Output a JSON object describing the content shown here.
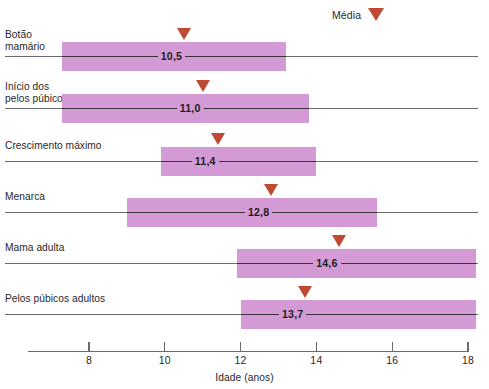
{
  "legend": {
    "label": "Média",
    "marker_icon": "down-triangle-icon",
    "marker_color": "#bf4a33"
  },
  "axis": {
    "title": "Idade (anos)",
    "ticks": [
      "8",
      "10",
      "12",
      "14",
      "16",
      "18"
    ],
    "tick_values": [
      8,
      10,
      12,
      14,
      16,
      18
    ],
    "min": 7.0,
    "max": 18.0
  },
  "colors": {
    "band": "#d49ad6",
    "marker": "#bf4a33",
    "line": "#6e6a6b",
    "text": "#2b2726"
  },
  "rows": [
    {
      "label": "Botão\nmamário",
      "value": "10,5",
      "mean": 10.5,
      "range_start": 7.3,
      "range_end": 13.2
    },
    {
      "label": "Início dos\npelos púbicos",
      "value": "11,0",
      "mean": 11.0,
      "range_start": 7.3,
      "range_end": 13.8
    },
    {
      "label": "Crescimento máximo",
      "value": "11,4",
      "mean": 11.4,
      "range_start": 9.9,
      "range_end": 14.0
    },
    {
      "label": "Menarca",
      "value": "12,8",
      "mean": 12.8,
      "range_start": 9.0,
      "range_end": 15.6
    },
    {
      "label": "Mama adulta",
      "value": "14,6",
      "mean": 14.6,
      "range_start": 11.9,
      "range_end": 18.2
    },
    {
      "label": "Pelos púbicos adultos",
      "value": "13,7",
      "mean": 13.7,
      "range_start": 12.0,
      "range_end": 18.2
    }
  ],
  "chart_data": {
    "type": "bar",
    "title": "",
    "subtitle": "",
    "xlabel": "Idade (anos)",
    "ylabel": "",
    "xlim": [
      7.0,
      18.0
    ],
    "grid": false,
    "legend_position": "top-right",
    "legend": [
      "Média"
    ],
    "categories": [
      "Botão mamário",
      "Início dos pelos púbicos",
      "Crescimento máximo",
      "Menarca",
      "Mama adulta",
      "Pelos púbicos adultos"
    ],
    "series": [
      {
        "name": "Média",
        "values": [
          10.5,
          11.0,
          11.4,
          12.8,
          14.6,
          13.7
        ]
      },
      {
        "name": "Faixa (início)",
        "values": [
          7.3,
          7.3,
          9.9,
          9.0,
          11.9,
          12.0
        ]
      },
      {
        "name": "Faixa (fim)",
        "values": [
          13.2,
          13.8,
          14.0,
          15.6,
          18.2,
          18.2
        ]
      }
    ],
    "data_labels": [
      "10,5",
      "11,0",
      "11,4",
      "12,8",
      "14,6",
      "13,7"
    ],
    "xticks": [
      8,
      10,
      12,
      14,
      16,
      18
    ]
  }
}
